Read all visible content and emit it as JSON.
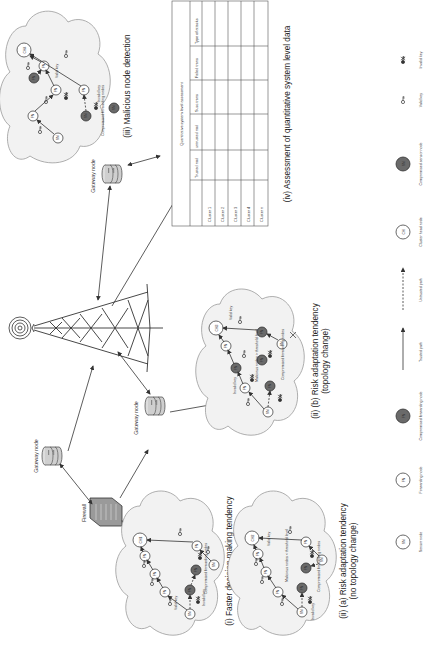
{
  "figure": {
    "orientation": "rotated-90-ccw",
    "infrastructure": {
      "tower_label": "",
      "gateway_label": "Gateway node",
      "firewall_label": "Firewall"
    },
    "panels": {
      "i": {
        "caption": "(i) Faster decision making tendency",
        "cluster_head": "CH1",
        "compromised_label": "Compromised forwarding nodes",
        "valid_key": "Valid key",
        "invalid_key": "Invalid key"
      },
      "ii_a": {
        "caption": "(ii) (a) Risk adaptation tendency",
        "caption_sub": "(no topology change)",
        "cluster_head": "CH2",
        "threshold_label": "Malicious nodes < threshold level",
        "compromised_label": "Compromised forwarding nodes",
        "valid_key": "Valid key",
        "invalid_key": "Invalid key"
      },
      "ii_b": {
        "caption": "(ii) (b) Risk adaptation tendency",
        "caption_sub": "(topology change)",
        "cluster_head": "CH3",
        "threshold_label": "Malicious nodes > threshold level",
        "compromised_label": "Compromised forwarding nodes",
        "valid_key": "Valid key",
        "invalid_key": "Invalid key"
      },
      "iii": {
        "caption": "(iii) Malicious node detection",
        "cluster_head": "CH4",
        "compromised_label": "Compromised forwarding nodes",
        "valid_key": "Valid key",
        "invalid_key": "Invalid key"
      },
      "iv": {
        "caption": "(iv) Assessment of quantitative system level data",
        "table": {
          "title": "Quantitative system level assessment",
          "columns": [
            "",
            "Trusted nod",
            "untrusted nod",
            "Succ.trans",
            "Failed trans",
            "Type of attacks"
          ],
          "rows": [
            {
              "label": "Cluster 1",
              "cells": [
                "",
                "",
                "",
                "",
                ""
              ]
            },
            {
              "label": "Cluster 2",
              "cells": [
                "",
                "",
                "",
                "",
                ""
              ]
            },
            {
              "label": "Cluster 3",
              "cells": [
                "",
                "",
                "",
                "",
                ""
              ]
            },
            {
              "label": "Cluster 4",
              "cells": [
                "",
                "",
                "",
                "",
                ""
              ]
            },
            {
              "label": "Cluster n",
              "cells": [
                "",
                "",
                "",
                "",
                ""
              ]
            }
          ]
        }
      }
    },
    "node_labels": {
      "sensor": "SN",
      "forwarding": "FN",
      "cluster_head": "CH"
    },
    "legend": [
      {
        "symbol": "SN",
        "kind": "sensor-node",
        "label": "Sensor node"
      },
      {
        "symbol": "FN",
        "kind": "forwarding-node",
        "label": "Forwarding node"
      },
      {
        "symbol": "FN",
        "kind": "compromised-forwarding-node",
        "label": "Compromised forwarding node"
      },
      {
        "symbol": "",
        "kind": "trusted-path",
        "label": "Trusted path"
      },
      {
        "symbol": "",
        "kind": "untrusted-path",
        "label": "Untrusted path"
      },
      {
        "symbol": "CH",
        "kind": "cluster-head-node",
        "label": "Cluster head node"
      },
      {
        "symbol": "SN",
        "kind": "compromised-sensor-node",
        "label": "Compromised sensor node"
      },
      {
        "symbol": "",
        "kind": "valid-key",
        "label": "Valid key"
      },
      {
        "symbol": "",
        "kind": "invalid-key",
        "label": "Invalid key"
      }
    ],
    "colors": {
      "cloud_fill": "#f2f2f2",
      "compromised_node": "#6a6a6a",
      "line": "#333333"
    }
  }
}
